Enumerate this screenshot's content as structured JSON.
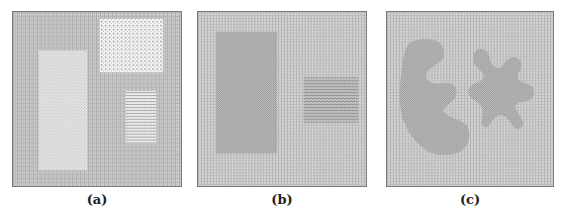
{
  "figure": {
    "panels": [
      {
        "id": "a",
        "caption": "(a)",
        "description": "Grid-texture background with three textured rectangular regions",
        "regions": [
          {
            "name": "dotted-white-rectangle",
            "texture": "sparse dots on white",
            "location": "top-right"
          },
          {
            "name": "stipple-tall-rectangle",
            "texture": "fine light stipple",
            "location": "left"
          },
          {
            "name": "horizontal-line-rectangle",
            "texture": "horizontal stripes",
            "location": "bottom-right"
          }
        ]
      },
      {
        "id": "b",
        "caption": "(b)",
        "description": "Grid-texture background with two darker checker-textured rectangles",
        "regions": [
          {
            "name": "checker-tall-rectangle",
            "texture": "dense checker",
            "location": "left"
          },
          {
            "name": "striped-checker-rectangle",
            "texture": "striped checker",
            "location": "right"
          }
        ]
      },
      {
        "id": "c",
        "caption": "(c)",
        "description": "Grid-texture background with two irregular textured blobs",
        "regions": [
          {
            "name": "crescent-blob",
            "texture": "dense checker",
            "location": "left"
          },
          {
            "name": "star-blob",
            "texture": "dense checker",
            "location": "right"
          }
        ]
      }
    ],
    "colors": {
      "background_grid_light": "#d4d4d4",
      "background_grid_dark": "#a9a9a9",
      "region_dark": "#9a9a9a",
      "region_white": "#f4f4f4",
      "border": "#7a7a7a"
    }
  }
}
